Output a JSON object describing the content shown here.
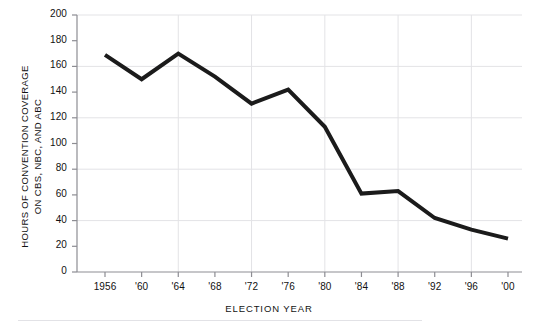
{
  "figure": {
    "top_clipped_text": "",
    "page_rule": true
  },
  "chart_data": {
    "type": "line",
    "title": "",
    "xlabel": "ELECTION  YEAR",
    "ylabel_line1": "HOURS OF CONVENTION COVERAGE",
    "ylabel_line2": "ON CBS, NBC, AND ABC",
    "categories": [
      "1956",
      "'60",
      "'64",
      "'68",
      "'72",
      "'76",
      "'80",
      "'84",
      "'88",
      "'92",
      "'96",
      "'00"
    ],
    "x": [
      1956,
      1960,
      1964,
      1968,
      1972,
      1976,
      1980,
      1984,
      1988,
      1992,
      1996,
      2000
    ],
    "values": [
      169,
      150,
      170,
      152,
      131,
      142,
      113,
      61,
      63,
      42,
      33,
      26
    ],
    "series": [
      {
        "name": "Hours of convention coverage on CBS, NBC, and ABC",
        "values": [
          169,
          150,
          170,
          152,
          131,
          142,
          113,
          61,
          63,
          42,
          33,
          26
        ]
      }
    ],
    "ylim": [
      0,
      200
    ],
    "ytick_values": [
      0,
      20,
      40,
      60,
      80,
      100,
      120,
      140,
      160,
      180,
      200
    ],
    "ytick_labels": [
      "0",
      "20",
      "40",
      "60",
      "80",
      "100",
      "120",
      "140",
      "160",
      "180",
      "200"
    ],
    "gridline_y_values": [
      40,
      80,
      120,
      160,
      200
    ],
    "gridline_x_categories": [
      "'64",
      "'72",
      "'80",
      "'88",
      "'96"
    ],
    "grid": true,
    "legend": false,
    "legend_position": "none",
    "line_color": "#1b1b1b",
    "grid_color": "#e3e3e6",
    "axis_color": "#8d8d93",
    "line_width": 4,
    "markers": false
  }
}
